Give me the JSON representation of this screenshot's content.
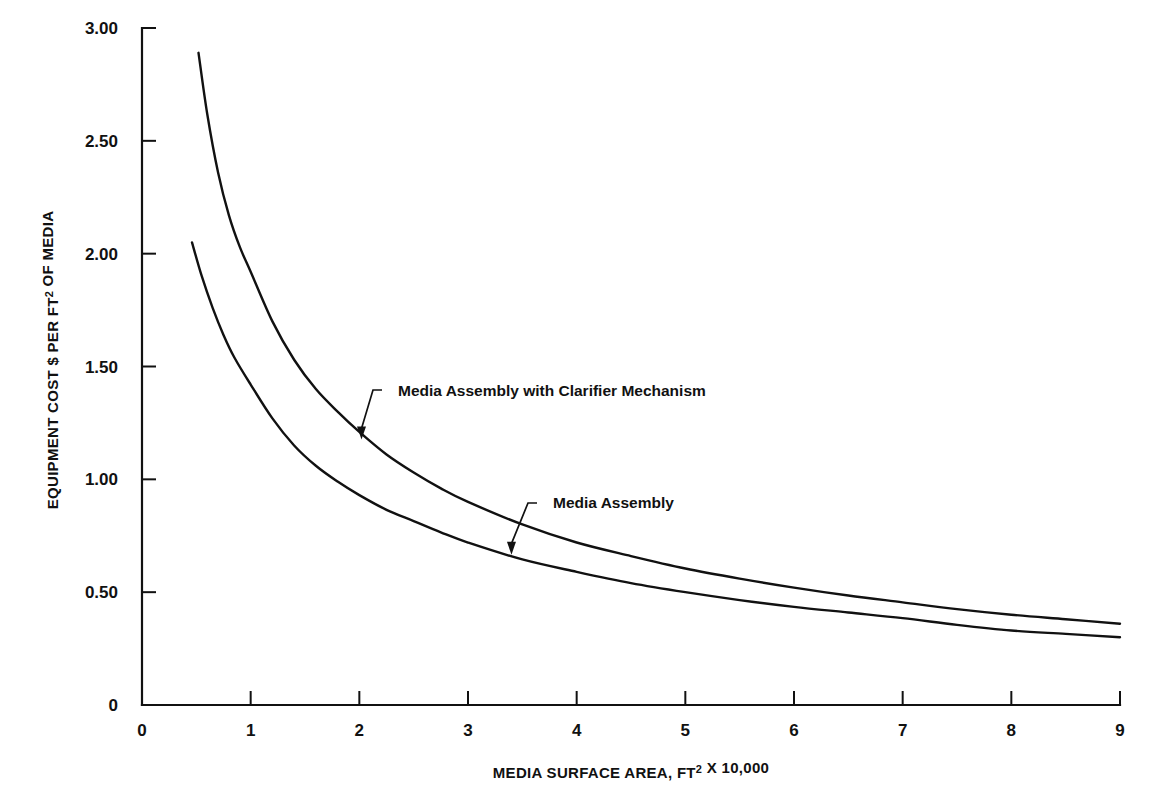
{
  "chart_data": {
    "type": "line",
    "title": "",
    "xlabel": "MEDIA SURFACE AREA, FT² X 10,000",
    "ylabel": "EQUIPMENT COST $ PER FT² OF MEDIA",
    "xlim": [
      0,
      9
    ],
    "ylim": [
      0,
      3.0
    ],
    "grid": false,
    "legend_position": "inline-annotations",
    "x_ticks": [
      0,
      1,
      2,
      3,
      4,
      5,
      6,
      7,
      8,
      9
    ],
    "x_tick_labels": [
      "0",
      "1",
      "2",
      "3",
      "4",
      "5",
      "6",
      "7",
      "8",
      "9"
    ],
    "y_ticks": [
      0,
      0.5,
      1.0,
      1.5,
      2.0,
      2.5,
      3.0
    ],
    "y_tick_labels": [
      "0",
      "0.50",
      "1.00",
      "1.50",
      "2.00",
      "2.50",
      "3.00"
    ],
    "series": [
      {
        "name": "Media Assembly with Clarifier Mechanism",
        "x": [
          0.52,
          0.6,
          0.7,
          0.8,
          0.9,
          1.0,
          1.2,
          1.4,
          1.6,
          1.8,
          2.0,
          2.25,
          2.5,
          2.75,
          3.0,
          3.5,
          4.0,
          4.5,
          5.0,
          5.5,
          6.0,
          6.5,
          7.0,
          7.5,
          8.0,
          8.5,
          9.0
        ],
        "values": [
          2.89,
          2.62,
          2.36,
          2.17,
          2.03,
          1.92,
          1.7,
          1.53,
          1.4,
          1.3,
          1.21,
          1.11,
          1.03,
          0.96,
          0.9,
          0.8,
          0.72,
          0.66,
          0.605,
          0.56,
          0.52,
          0.485,
          0.455,
          0.425,
          0.4,
          0.38,
          0.36
        ]
      },
      {
        "name": "Media Assembly",
        "x": [
          0.46,
          0.55,
          0.65,
          0.75,
          0.85,
          1.0,
          1.2,
          1.4,
          1.6,
          1.8,
          2.0,
          2.25,
          2.5,
          2.75,
          3.0,
          3.5,
          4.0,
          4.5,
          5.0,
          5.5,
          6.0,
          6.5,
          7.0,
          7.5,
          8.0,
          8.5,
          9.0
        ],
        "values": [
          2.05,
          1.9,
          1.76,
          1.64,
          1.54,
          1.42,
          1.27,
          1.15,
          1.06,
          0.99,
          0.93,
          0.865,
          0.815,
          0.765,
          0.72,
          0.645,
          0.59,
          0.54,
          0.5,
          0.465,
          0.435,
          0.41,
          0.385,
          0.355,
          0.33,
          0.315,
          0.3
        ]
      }
    ],
    "annotations": [
      {
        "label": "Media Assembly with Clarifier Mechanism",
        "points_to_x": 2.02,
        "points_to_y": 1.185
      },
      {
        "label": "Media Assembly",
        "points_to_x": 3.4,
        "points_to_y": 0.675
      }
    ]
  },
  "style": {
    "ink_color": "#111111",
    "background_color": "#ffffff"
  }
}
